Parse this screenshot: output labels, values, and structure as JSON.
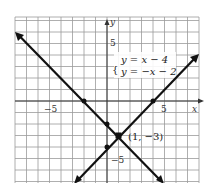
{
  "chart_data": {
    "type": "line",
    "title": "",
    "xlabel": "x",
    "ylabel": "y",
    "xlim": [
      -8,
      8
    ],
    "ylim": [
      -7,
      7.3
    ],
    "grid": true,
    "x_tick_labels": [
      "-5",
      "5"
    ],
    "y_tick_labels": [
      "5",
      "-5"
    ],
    "legend": [
      "y = x − 4",
      "y = −x − 2"
    ],
    "series": [
      {
        "name": "y = x − 4",
        "slope": 1,
        "intercept": -4,
        "x": [
          -3,
          8
        ],
        "y": [
          -7,
          4
        ],
        "marked_points": [
          [
            4,
            0
          ],
          [
            0,
            -4
          ]
        ]
      },
      {
        "name": "y = −x − 2",
        "slope": -1,
        "intercept": -2,
        "x": [
          -8,
          5
        ],
        "y": [
          6,
          -7
        ],
        "marked_points": [
          [
            -2,
            0
          ],
          [
            0,
            -2
          ]
        ]
      }
    ],
    "annotations": [
      {
        "text": "(1, −3)",
        "x": 1,
        "y": -3,
        "note": "intersection point"
      }
    ]
  },
  "labels": {
    "x_axis": "x",
    "y_axis": "y",
    "x_tick_neg5": "−5",
    "x_tick_5": "5",
    "y_tick_5": "5",
    "y_tick_neg5": "−5",
    "eq1": "y = x − 4",
    "eq2": "y = −x − 2",
    "intersection": "(1, −3)"
  }
}
